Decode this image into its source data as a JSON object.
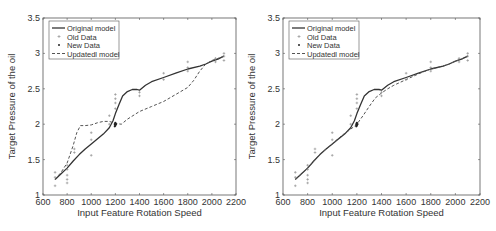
{
  "figure": {
    "panel_count": 2
  },
  "chart_data": [
    {
      "type": "line",
      "panel": "left",
      "title": "",
      "xlabel": "Input Feature Rotation Speed",
      "ylabel": "Target Pressure of the oil",
      "xlim": [
        600,
        2200
      ],
      "ylim": [
        1,
        3.5
      ],
      "xticks": [
        600,
        800,
        1000,
        1200,
        1400,
        1600,
        1800,
        2000,
        2200
      ],
      "yticks": [
        1,
        1.5,
        2,
        2.5,
        3,
        3.5
      ],
      "ytick_labels": [
        "1",
        "1.5",
        "2",
        "2.5",
        "3",
        "3.5"
      ],
      "grid": false,
      "legend_position": "upper left",
      "legend": [
        "Original model",
        "Old Data",
        "New Data",
        "Updatedl model"
      ],
      "series": [
        {
          "name": "Original model",
          "style": "solid",
          "color": "#333333",
          "x": [
            700,
            750,
            800,
            850,
            900,
            950,
            1000,
            1050,
            1100,
            1150,
            1180,
            1200,
            1230,
            1260,
            1300,
            1340,
            1380,
            1400,
            1450,
            1500,
            1600,
            1700,
            1800,
            1900,
            1950,
            2000,
            2050,
            2100
          ],
          "y": [
            1.22,
            1.3,
            1.38,
            1.48,
            1.57,
            1.65,
            1.72,
            1.79,
            1.86,
            1.95,
            2.05,
            2.15,
            2.28,
            2.4,
            2.46,
            2.49,
            2.49,
            2.48,
            2.55,
            2.6,
            2.66,
            2.72,
            2.78,
            2.82,
            2.85,
            2.89,
            2.92,
            2.96
          ]
        },
        {
          "name": "Updatedl model",
          "style": "dashed",
          "color": "#555555",
          "x": [
            700,
            750,
            800,
            850,
            880,
            910,
            950,
            1000,
            1050,
            1100,
            1150,
            1200,
            1250,
            1300,
            1400,
            1500,
            1600,
            1700,
            1800,
            1850,
            1900,
            1950,
            2000,
            2050,
            2100
          ],
          "y": [
            1.22,
            1.32,
            1.45,
            1.7,
            1.88,
            1.98,
            1.98,
            1.99,
            2.02,
            2.04,
            2.04,
            2.01,
            2.0,
            2.07,
            2.18,
            2.25,
            2.32,
            2.42,
            2.52,
            2.62,
            2.75,
            2.85,
            2.9,
            2.93,
            2.96
          ]
        },
        {
          "name": "Old Data",
          "style": "markers",
          "marker": "+",
          "color": "#888888",
          "x": [
            700,
            700,
            700,
            800,
            800,
            800,
            800,
            800,
            860,
            860,
            1000,
            1000,
            1000,
            1150,
            1150,
            1200,
            1200,
            1200,
            1200,
            1400,
            1400,
            1600,
            1600,
            1800,
            1800,
            1800,
            2030,
            2030,
            2100,
            2100,
            2100
          ],
          "y": [
            1.13,
            1.25,
            1.32,
            1.17,
            1.22,
            1.28,
            1.36,
            1.42,
            1.6,
            1.65,
            1.56,
            1.78,
            1.88,
            2.0,
            2.12,
            2.22,
            2.3,
            2.36,
            2.42,
            2.4,
            2.45,
            2.63,
            2.72,
            2.75,
            2.8,
            2.88,
            2.88,
            2.93,
            2.9,
            2.96,
            3.0
          ]
        },
        {
          "name": "New Data",
          "style": "markers",
          "marker": ".",
          "color": "#222222",
          "x": [
            1195,
            1195,
            1200,
            1200,
            1205
          ],
          "y": [
            1.97,
            2.0,
            1.98,
            2.02,
            2.0
          ]
        }
      ]
    },
    {
      "type": "line",
      "panel": "right",
      "title": "",
      "xlabel": "Input Feature Rotation Speed",
      "ylabel": "Target Pressure of the oil",
      "xlim": [
        600,
        2200
      ],
      "ylim": [
        1,
        3.5
      ],
      "xticks": [
        600,
        800,
        1000,
        1200,
        1400,
        1600,
        1800,
        2000,
        2200
      ],
      "yticks": [
        1,
        1.5,
        2,
        2.5,
        3,
        3.5
      ],
      "ytick_labels": [
        "1",
        "1.5",
        "2",
        "2.5",
        "3",
        "3.5"
      ],
      "grid": false,
      "legend_position": "upper left",
      "legend": [
        "Original model",
        "Old Data",
        "New Data",
        "Updatedl model"
      ],
      "series": [
        {
          "name": "Original model",
          "style": "solid",
          "color": "#333333",
          "x": [
            700,
            750,
            800,
            850,
            900,
            950,
            1000,
            1050,
            1100,
            1150,
            1180,
            1200,
            1230,
            1260,
            1300,
            1340,
            1380,
            1400,
            1450,
            1500,
            1600,
            1700,
            1800,
            1900,
            1950,
            2000,
            2050,
            2100
          ],
          "y": [
            1.22,
            1.3,
            1.38,
            1.48,
            1.57,
            1.65,
            1.72,
            1.79,
            1.86,
            1.95,
            2.05,
            2.15,
            2.28,
            2.4,
            2.46,
            2.49,
            2.49,
            2.48,
            2.55,
            2.6,
            2.66,
            2.72,
            2.78,
            2.82,
            2.85,
            2.89,
            2.92,
            2.96
          ]
        },
        {
          "name": "Updatedl model",
          "style": "dashed",
          "color": "#555555",
          "x": [
            700,
            750,
            800,
            850,
            900,
            950,
            1000,
            1050,
            1100,
            1150,
            1200,
            1250,
            1300,
            1350,
            1400,
            1450,
            1500,
            1600,
            1700,
            1800,
            1900,
            1950,
            2000,
            2050,
            2100
          ],
          "y": [
            1.22,
            1.3,
            1.38,
            1.48,
            1.57,
            1.65,
            1.72,
            1.8,
            1.87,
            1.93,
            2.0,
            2.12,
            2.25,
            2.37,
            2.44,
            2.5,
            2.55,
            2.63,
            2.71,
            2.78,
            2.82,
            2.85,
            2.89,
            2.92,
            2.96
          ]
        },
        {
          "name": "Old Data",
          "style": "markers",
          "marker": "+",
          "color": "#888888",
          "x": [
            700,
            700,
            700,
            800,
            800,
            800,
            800,
            800,
            860,
            860,
            1000,
            1000,
            1000,
            1150,
            1150,
            1200,
            1200,
            1200,
            1200,
            1400,
            1400,
            1600,
            1600,
            1800,
            1800,
            1800,
            2030,
            2030,
            2100,
            2100,
            2100
          ],
          "y": [
            1.13,
            1.25,
            1.32,
            1.17,
            1.22,
            1.28,
            1.36,
            1.42,
            1.6,
            1.65,
            1.56,
            1.78,
            1.88,
            2.0,
            2.12,
            2.22,
            2.3,
            2.36,
            2.42,
            2.4,
            2.45,
            2.63,
            2.72,
            2.75,
            2.8,
            2.88,
            2.88,
            2.93,
            2.9,
            2.96,
            3.0
          ]
        },
        {
          "name": "New Data",
          "style": "markers",
          "marker": ".",
          "color": "#222222",
          "x": [
            1195,
            1195,
            1200,
            1200,
            1205
          ],
          "y": [
            1.97,
            2.0,
            1.98,
            2.02,
            2.0
          ]
        }
      ]
    }
  ]
}
